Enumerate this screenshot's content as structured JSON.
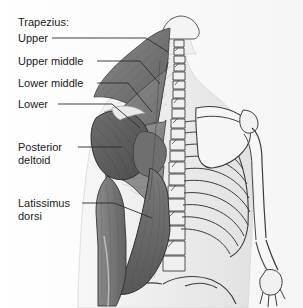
{
  "figure": {
    "width": 303,
    "height": 308,
    "background_color": "#fdfdfd",
    "label_color": "#1a1a1a",
    "leader_color": "#2b2b2b"
  },
  "labels": {
    "group_heading": "Trapezius:",
    "upper": "Upper",
    "upper_middle": "Upper middle",
    "lower_middle": "Lower middle",
    "lower": "Lower",
    "posterior_deltoid_line1": "Posterior",
    "posterior_deltoid_line2": "deltoid",
    "latissimus_line1": "Latissimus",
    "latissimus_line2": "dorsi"
  },
  "anatomy": {
    "muscles": [
      {
        "name": "trapezius-upper",
        "tone": "#6f6f6f"
      },
      {
        "name": "trapezius-upper-middle",
        "tone": "#7b7b7b"
      },
      {
        "name": "trapezius-lower-middle",
        "tone": "#858585"
      },
      {
        "name": "trapezius-lower",
        "tone": "#909090"
      },
      {
        "name": "posterior-deltoid",
        "tone": "#5e5e5e"
      },
      {
        "name": "latissimus-dorsi",
        "tone": "#6b6b6b"
      },
      {
        "name": "infraspinatus",
        "tone": "#747474"
      },
      {
        "name": "teres-major",
        "tone": "#636363"
      },
      {
        "name": "triceps",
        "tone": "#7f7f7f"
      }
    ],
    "bones": [
      {
        "name": "skull-base",
        "tone": "#f0f0f0"
      },
      {
        "name": "cervical-vertebrae",
        "tone": "#ededed"
      },
      {
        "name": "thoracic-vertebrae",
        "tone": "#ededed"
      },
      {
        "name": "lumbar-vertebrae",
        "tone": "#ededed"
      },
      {
        "name": "ribcage",
        "tone": "#f2f2f2"
      },
      {
        "name": "scapula",
        "tone": "#f4f4f4"
      },
      {
        "name": "humerus",
        "tone": "#f0f0f0"
      },
      {
        "name": "radius-ulna",
        "tone": "#f0f0f0"
      },
      {
        "name": "hand-bones",
        "tone": "#efefef"
      },
      {
        "name": "pelvis",
        "tone": "#f3f3f3"
      }
    ],
    "rib_count": 10
  }
}
